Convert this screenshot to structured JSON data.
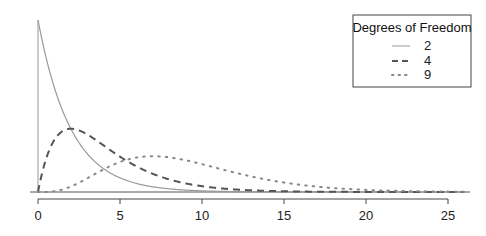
{
  "chart_data": {
    "type": "line",
    "title": "",
    "xlabel": "",
    "ylabel": "",
    "xlim": [
      0,
      26
    ],
    "ylim": [
      0,
      0.5
    ],
    "x_ticks": [
      "0",
      "5",
      "10",
      "15",
      "20",
      "25"
    ],
    "x_tick_values": [
      0,
      5,
      10,
      15,
      20,
      25
    ],
    "grid": false,
    "legend": {
      "title": "Degrees of Freedom",
      "placement": "top-right"
    },
    "series": [
      {
        "name": "2",
        "df": 2,
        "style": "solid",
        "color": "#999999",
        "distribution": "chi-square"
      },
      {
        "name": "4",
        "df": 4,
        "style": "dashed",
        "color": "#555555",
        "distribution": "chi-square"
      },
      {
        "name": "9",
        "df": 9,
        "style": "dotted",
        "color": "#888888",
        "distribution": "chi-square"
      }
    ]
  }
}
